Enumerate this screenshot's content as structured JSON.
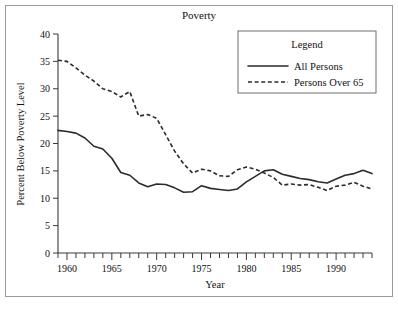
{
  "figure": {
    "title": "Poverty",
    "frame_border_color": "#9a9a9a",
    "background": "#ffffff"
  },
  "axes": {
    "xlabel": "Year",
    "ylabel": "Percent Below Poverty Level",
    "x_tick_labels": [
      "1960",
      "1965",
      "1970",
      "1975",
      "1980",
      "1985",
      "1990"
    ],
    "y_tick_labels": [
      "0",
      "5",
      "10",
      "15",
      "20",
      "25",
      "30",
      "35",
      "40"
    ]
  },
  "legend": {
    "title": "Legend",
    "entries": [
      {
        "label": "All Persons",
        "style": "solid"
      },
      {
        "label": "Persons Over 65",
        "style": "dashed"
      }
    ]
  },
  "chart_data": {
    "type": "line",
    "title": "Poverty",
    "xlabel": "Year",
    "ylabel": "Percent Below Poverty Level",
    "xlim": [
      1959,
      1994
    ],
    "ylim": [
      0,
      40
    ],
    "xticks": [
      1960,
      1965,
      1970,
      1975,
      1980,
      1985,
      1990
    ],
    "yticks": [
      0,
      5,
      10,
      15,
      20,
      25,
      30,
      35,
      40
    ],
    "minor_xtick_interval": 1,
    "grid": false,
    "legend_position": "top-right",
    "x": [
      1959,
      1960,
      1961,
      1962,
      1963,
      1964,
      1965,
      1966,
      1967,
      1968,
      1969,
      1970,
      1971,
      1972,
      1973,
      1974,
      1975,
      1976,
      1977,
      1978,
      1979,
      1980,
      1981,
      1982,
      1983,
      1984,
      1985,
      1986,
      1987,
      1988,
      1989,
      1990,
      1991,
      1992,
      1993,
      1994
    ],
    "series": [
      {
        "name": "All Persons",
        "style": "solid",
        "color": "#2b2b2b",
        "values": [
          22.4,
          22.2,
          21.9,
          21.0,
          19.5,
          19.0,
          17.3,
          14.7,
          14.2,
          12.8,
          12.1,
          12.6,
          12.5,
          11.9,
          11.1,
          11.2,
          12.3,
          11.8,
          11.6,
          11.4,
          11.7,
          13.0,
          14.0,
          15.0,
          15.2,
          14.4,
          14.0,
          13.6,
          13.4,
          13.0,
          12.8,
          13.5,
          14.2,
          14.5,
          15.1,
          14.5
        ]
      },
      {
        "name": "Persons Over 65",
        "style": "dashed",
        "color": "#2b2b2b",
        "values": [
          35.2,
          35.0,
          33.8,
          32.5,
          31.4,
          30.0,
          29.5,
          28.5,
          29.5,
          25.0,
          25.3,
          24.6,
          21.6,
          18.6,
          16.3,
          14.6,
          15.3,
          15.0,
          14.1,
          14.0,
          15.2,
          15.7,
          15.3,
          14.6,
          13.8,
          12.4,
          12.6,
          12.4,
          12.5,
          12.0,
          11.4,
          12.2,
          12.4,
          12.9,
          12.2,
          11.7
        ]
      }
    ]
  },
  "geometry": {
    "plot_left": 58,
    "plot_right": 372,
    "plot_top": 34,
    "plot_bottom": 253,
    "legend_box": {
      "x": 238,
      "y": 31,
      "w": 138,
      "h": 62
    }
  }
}
